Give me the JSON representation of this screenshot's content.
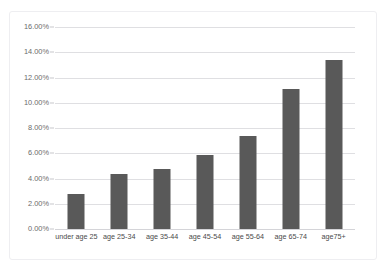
{
  "chart_data": {
    "type": "bar",
    "title": "",
    "xlabel": "",
    "ylabel": "",
    "categories": [
      "under age 25",
      "age 25-34",
      "age 35-44",
      "age 45-54",
      "age 55-64",
      "age 65-74",
      "age75+"
    ],
    "values": [
      2.8,
      4.35,
      4.75,
      5.85,
      7.4,
      11.1,
      13.4
    ],
    "value_labels": [
      "2.80%",
      "4.35%",
      "4.75%",
      "5.85%",
      "7.40%",
      "11.10%",
      "13.40%"
    ],
    "ylim": [
      0,
      16
    ],
    "ytick_values": [
      0,
      2,
      4,
      6,
      8,
      10,
      12,
      14,
      16
    ],
    "ytick_labels": [
      "0.00%",
      "2.00%",
      "4.00%",
      "6.00%",
      "8.00%",
      "10.00%",
      "12.00%",
      "14.00%",
      "16.00%"
    ],
    "grid": true,
    "legend": false,
    "legend_position": "none",
    "series": [
      {
        "name": "rate by age group",
        "values": [
          2.8,
          4.35,
          4.75,
          5.85,
          7.4,
          11.1,
          13.4
        ]
      }
    ]
  },
  "colors": {
    "bar": "#595959",
    "gridline": "#dfdfe2",
    "baseline": "#d4d4d8",
    "frame_border": "#eeeef1",
    "tick_text": "#6b6b6b",
    "category_text": "#4a4a4a",
    "background": "#ffffff"
  }
}
